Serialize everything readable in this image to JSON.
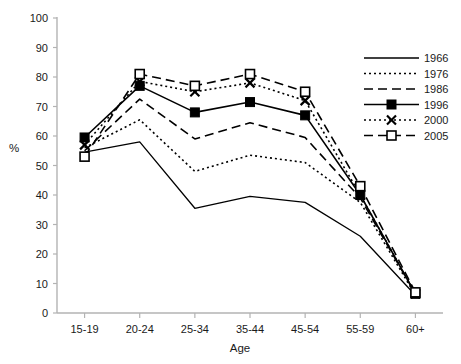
{
  "chart_data": {
    "type": "line",
    "title": "",
    "subtitle": "",
    "xlabel": "Age",
    "ylabel": "%",
    "categories": [
      "15-19",
      "20-24",
      "25-34",
      "35-44",
      "45-54",
      "55-59",
      "60+"
    ],
    "ylim": [
      0,
      100
    ],
    "ytick_step": 10,
    "yticks": [
      "0",
      "10",
      "20",
      "30",
      "40",
      "50",
      "60",
      "70",
      "80",
      "90",
      "100"
    ],
    "grid": false,
    "legend_position": "top-right",
    "series": [
      {
        "name": "1966",
        "style": "solid",
        "marker": "none",
        "color": "#000000",
        "values": [
          54.5,
          58.0,
          35.5,
          39.5,
          37.5,
          26.0,
          6.0
        ]
      },
      {
        "name": "1976",
        "style": "dotted",
        "marker": "none",
        "color": "#000000",
        "values": [
          56.0,
          65.5,
          48.0,
          53.5,
          51.0,
          37.5,
          6.0
        ]
      },
      {
        "name": "1986",
        "style": "dashed",
        "marker": "none",
        "color": "#000000",
        "values": [
          55.0,
          72.5,
          59.0,
          64.5,
          59.5,
          39.0,
          6.5
        ]
      },
      {
        "name": "1996",
        "style": "solid",
        "marker": "filled-square",
        "color": "#000000",
        "values": [
          59.5,
          77.0,
          68.0,
          71.5,
          67.0,
          40.0,
          6.5
        ]
      },
      {
        "name": "2000",
        "style": "dotted",
        "marker": "x",
        "color": "#000000",
        "values": [
          57.0,
          78.5,
          75.0,
          78.0,
          72.0,
          40.0,
          6.5
        ]
      },
      {
        "name": "2005",
        "style": "dashed",
        "marker": "open-square",
        "color": "#000000",
        "values": [
          53.0,
          81.0,
          77.0,
          81.0,
          75.0,
          43.0,
          7.0
        ]
      }
    ]
  },
  "axes": {
    "y_axis_label": "%",
    "x_axis_label": "Age"
  },
  "legend": {
    "entries": [
      "1966",
      "1976",
      "1986",
      "1996",
      "2000",
      "2005"
    ]
  },
  "colors": {
    "line": "#000000",
    "axis": "#b3b3b3",
    "text": "#1a1a1a",
    "background": "#ffffff"
  }
}
